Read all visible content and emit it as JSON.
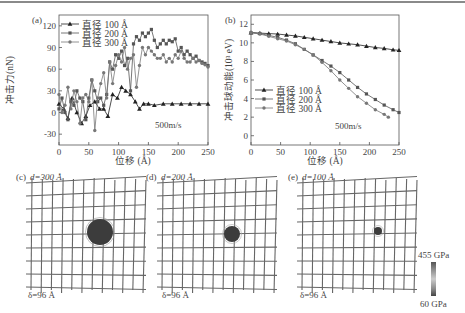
{
  "figure": {
    "top_rule": true
  },
  "chart_data": [
    {
      "panel": "(a)",
      "type": "line",
      "title": "",
      "xlabel": "位移 (Å)",
      "ylabel": "冲击力(nN)",
      "xlim": [
        0,
        250
      ],
      "ylim": [
        -45,
        135
      ],
      "xticks": [
        0,
        50,
        100,
        150,
        200,
        250
      ],
      "yticks": [
        -30,
        0,
        30,
        60,
        90,
        120
      ],
      "annotation": "500m/s",
      "legend_position": "upper left",
      "grid": false,
      "series": [
        {
          "name": "直径 100 Å",
          "marker": "triangle",
          "x": [
            0,
            8,
            15,
            22,
            30,
            38,
            45,
            52,
            60,
            68,
            75,
            82,
            90,
            98,
            105,
            112,
            120,
            128,
            135,
            142,
            150,
            160,
            175,
            190,
            205,
            220,
            235,
            250
          ],
          "y": [
            12,
            5,
            -8,
            20,
            0,
            -15,
            -5,
            10,
            15,
            5,
            5,
            -5,
            25,
            20,
            35,
            30,
            25,
            15,
            5,
            12,
            12,
            10,
            12,
            12,
            12,
            12,
            12,
            12
          ]
        },
        {
          "name": "直径 200 Å",
          "marker": "square",
          "x": [
            0,
            5,
            10,
            15,
            20,
            25,
            30,
            35,
            40,
            45,
            50,
            55,
            60,
            65,
            70,
            75,
            80,
            85,
            90,
            95,
            100,
            105,
            110,
            115,
            120,
            125,
            130,
            135,
            140,
            145,
            150,
            155,
            160,
            165,
            170,
            175,
            180,
            185,
            190,
            195,
            200,
            205,
            210,
            215,
            220,
            225,
            230,
            235,
            240,
            245,
            250
          ],
          "y": [
            5,
            20,
            0,
            -10,
            15,
            10,
            30,
            20,
            15,
            -10,
            20,
            45,
            30,
            15,
            20,
            10,
            25,
            70,
            60,
            80,
            75,
            85,
            65,
            75,
            30,
            95,
            105,
            100,
            110,
            105,
            110,
            115,
            100,
            90,
            95,
            100,
            95,
            100,
            98,
            102,
            85,
            90,
            80,
            85,
            80,
            75,
            78,
            72,
            70,
            68,
            65
          ],
          "note": "approximate reading"
        },
        {
          "name": "直径 300 Å",
          "marker": "circle",
          "x": [
            0,
            5,
            10,
            15,
            20,
            25,
            30,
            35,
            40,
            45,
            50,
            55,
            60,
            65,
            70,
            75,
            80,
            85,
            90,
            95,
            100,
            105,
            110,
            115,
            120,
            125,
            130,
            135,
            140,
            145,
            150,
            155,
            160,
            165,
            170,
            175,
            180,
            185,
            190,
            195,
            200,
            205,
            210,
            215,
            220,
            225,
            230,
            235,
            240,
            245,
            250
          ],
          "y": [
            25,
            0,
            10,
            35,
            5,
            30,
            15,
            -15,
            20,
            25,
            15,
            45,
            -25,
            20,
            40,
            55,
            20,
            70,
            40,
            65,
            80,
            70,
            90,
            60,
            75,
            80,
            35,
            65,
            90,
            80,
            90,
            85,
            80,
            75,
            75,
            80,
            70,
            75,
            70,
            80,
            75,
            85,
            75,
            70,
            70,
            75,
            70,
            72,
            68,
            66,
            63
          ],
          "note": "approximate reading"
        }
      ]
    },
    {
      "panel": "(b)",
      "type": "line",
      "title": "",
      "xlabel": "位移 (Å)",
      "ylabel": "冲击球动能(10^3 eV)",
      "xlim": [
        0,
        250
      ],
      "ylim": [
        -1,
        13
      ],
      "xticks": [
        0,
        50,
        100,
        150,
        200,
        250
      ],
      "yticks": [
        0,
        2,
        4,
        6,
        8,
        10,
        12
      ],
      "annotation": "500m/s",
      "legend_position": "center left",
      "grid": false,
      "series": [
        {
          "name": "直径 100 Å",
          "marker": "triangle",
          "x": [
            0,
            15,
            30,
            45,
            60,
            75,
            90,
            105,
            120,
            135,
            150,
            165,
            180,
            195,
            210,
            225,
            240,
            250
          ],
          "y": [
            11.1,
            11.05,
            11.0,
            10.95,
            10.85,
            10.75,
            10.6,
            10.45,
            10.3,
            10.15,
            10.0,
            9.9,
            9.8,
            9.65,
            9.5,
            9.4,
            9.25,
            9.2
          ]
        },
        {
          "name": "直径 200 Å",
          "marker": "square",
          "x": [
            0,
            15,
            30,
            45,
            60,
            75,
            90,
            105,
            120,
            135,
            150,
            165,
            180,
            195,
            210,
            225,
            240,
            250
          ],
          "y": [
            11.1,
            11.0,
            10.8,
            10.6,
            10.3,
            9.9,
            9.3,
            8.7,
            8.1,
            7.5,
            6.8,
            6.0,
            5.2,
            4.5,
            3.9,
            3.3,
            2.8,
            2.5
          ]
        },
        {
          "name": "直径 300 Å",
          "marker": "circle",
          "x": [
            0,
            15,
            30,
            45,
            60,
            75,
            90,
            105,
            120,
            135,
            150,
            165,
            180,
            195,
            210,
            225,
            232
          ],
          "y": [
            11.1,
            10.95,
            10.7,
            10.45,
            10.2,
            9.8,
            9.3,
            8.7,
            7.9,
            7.0,
            6.0,
            5.1,
            4.2,
            3.5,
            2.8,
            2.3,
            2.0
          ]
        }
      ]
    }
  ],
  "panels": {
    "a": {
      "label": "(a)",
      "ylabel": "冲击力(nN)",
      "xlabel": "位移 (Å)",
      "annotation": "500m/s",
      "xticks": [
        "0",
        "50",
        "100",
        "150",
        "200",
        "250"
      ],
      "yticks": [
        "-30",
        "0",
        "30",
        "60",
        "90",
        "120"
      ],
      "legend": [
        "直径 100 Å",
        "直径 200 Å",
        "直径 300 Å"
      ]
    },
    "b": {
      "label": "(b)",
      "ylabel": "冲击球动能(10³ eV)",
      "xlabel": "位移 (Å)",
      "annotation": "500m/s",
      "xticks": [
        "0",
        "50",
        "100",
        "150",
        "200",
        "250"
      ],
      "yticks": [
        "0",
        "2",
        "4",
        "6",
        "8",
        "10",
        "12"
      ],
      "legend": [
        "直径 100 Å",
        "直径 200 Å",
        "直径 300 Å"
      ]
    },
    "c": {
      "label": "(c)",
      "diameter": "d=300 Å",
      "delta": "δ=96 Å"
    },
    "d": {
      "label": "(d)",
      "diameter": "d=200 Å",
      "delta": "δ=96 Å"
    },
    "e": {
      "label": "(e)",
      "diameter": "d=100 Å",
      "delta": "δ=96 Å"
    },
    "colorbar": {
      "max": "455 GPa",
      "min": "60 GPa"
    }
  },
  "colors": {
    "series_100": "#222222",
    "series_200": "#555555",
    "series_300": "#777777",
    "axis": "#555555",
    "grid_lines": "#666666",
    "impact_ball": "#3a3a3a"
  }
}
